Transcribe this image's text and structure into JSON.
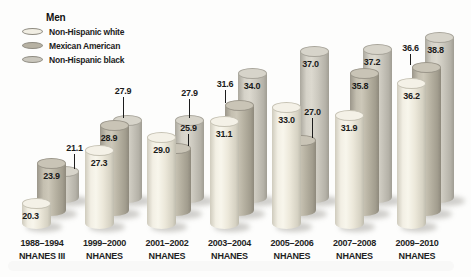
{
  "legend": {
    "title": "Men",
    "items": [
      {
        "label": "Non-Hispanic white",
        "color": "#f1eee3"
      },
      {
        "label": "Mexican American",
        "color": "#b7b2a3"
      },
      {
        "label": "Non-Hispanic black",
        "color": "#cac7bd"
      }
    ]
  },
  "chart_data": {
    "type": "bar",
    "subtype": "3d-cylinder",
    "title": "Men",
    "legend_position": "top-left",
    "value_labels_shown": true,
    "axes": {
      "value_axis_shown": false,
      "gridlines": false,
      "value_min_implied": 17
    },
    "categories": [
      {
        "years": "1988–1994",
        "survey": "NHANES III"
      },
      {
        "years": "1999–2000",
        "survey": "NHANES"
      },
      {
        "years": "2001–2002",
        "survey": "NHANES"
      },
      {
        "years": "2003–2004",
        "survey": "NHANES"
      },
      {
        "years": "2005–2006",
        "survey": "NHANES"
      },
      {
        "years": "2007–2008",
        "survey": "NHANES"
      },
      {
        "years": "2009–2010",
        "survey": "NHANES"
      }
    ],
    "series": [
      {
        "name": "Non-Hispanic white",
        "values": [
          20.3,
          27.3,
          29.0,
          31.1,
          33.0,
          31.9,
          36.2
        ]
      },
      {
        "name": "Mexican American",
        "values": [
          23.9,
          28.9,
          25.9,
          31.6,
          27.0,
          35.8,
          36.6
        ]
      },
      {
        "name": "Non-Hispanic black",
        "values": [
          21.1,
          27.9,
          27.9,
          34.0,
          37.0,
          37.2,
          38.8
        ]
      }
    ],
    "callout_labels": [
      {
        "series": "Non-Hispanic black",
        "category": "1988–1994",
        "value": 21.1
      },
      {
        "series": "Non-Hispanic black",
        "category": "1999–2000",
        "value": 27.9
      },
      {
        "series": "Non-Hispanic black",
        "category": "2001–2002",
        "value": 27.9
      },
      {
        "series": "Mexican American",
        "category": "2001–2002",
        "value": 25.9
      },
      {
        "series": "Mexican American",
        "category": "2003–2004",
        "value": 31.6
      },
      {
        "series": "Mexican American",
        "category": "2005–2006",
        "value": 27.0
      },
      {
        "series": "Mexican American",
        "category": "2009–2010",
        "value": 36.6
      }
    ]
  }
}
